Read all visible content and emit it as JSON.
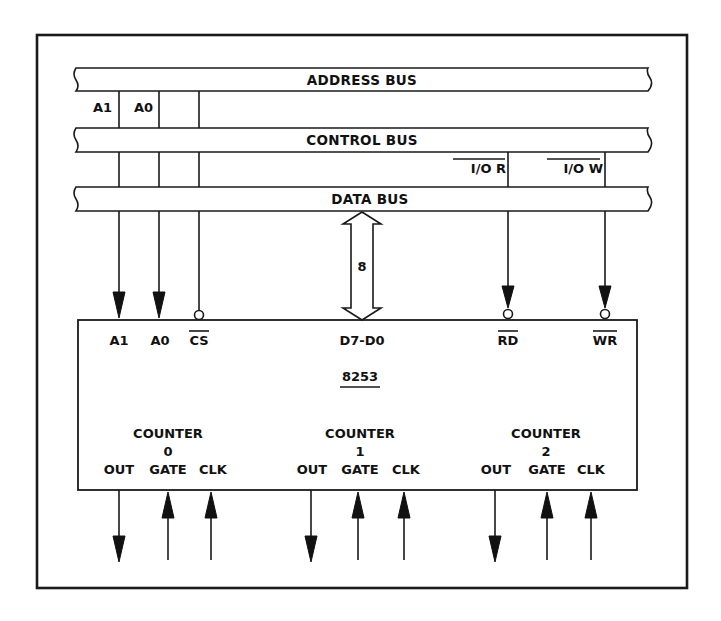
{
  "diagram": {
    "buses": [
      {
        "id": "address",
        "label": "ADDRESS BUS"
      },
      {
        "id": "control",
        "label": "CONTROL BUS"
      },
      {
        "id": "data",
        "label": "DATA BUS"
      }
    ],
    "address_taps": {
      "a1": "A1",
      "a0": "A0"
    },
    "control_taps": {
      "io_read": "I/O R",
      "io_write": "I/O W"
    },
    "data_bus_width": "8",
    "chip": {
      "name": "8253",
      "pins_top": {
        "a1": "A1",
        "a0": "A0",
        "cs": "CS",
        "data": "D7-D0",
        "rd": "RD",
        "wr": "WR"
      },
      "counters": [
        {
          "title": "COUNTER",
          "number": "0",
          "out": "OUT",
          "gate": "GATE",
          "clk": "CLK"
        },
        {
          "title": "COUNTER",
          "number": "1",
          "out": "OUT",
          "gate": "GATE",
          "clk": "CLK"
        },
        {
          "title": "COUNTER",
          "number": "2",
          "out": "OUT",
          "gate": "GATE",
          "clk": "CLK"
        }
      ]
    },
    "colors": {
      "line": "#1a1a1a",
      "background": "#ffffff"
    }
  }
}
